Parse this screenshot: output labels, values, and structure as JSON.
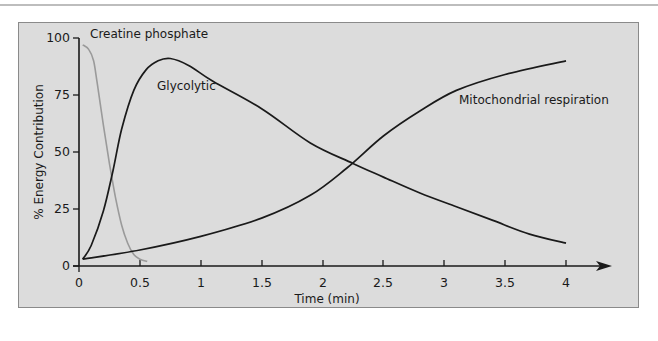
{
  "chart_data": {
    "type": "line",
    "title": "",
    "xlabel": "Time (min)",
    "ylabel": "% Energy Contribution",
    "xlim": [
      0,
      4
    ],
    "ylim": [
      0,
      100
    ],
    "x_ticks": [
      "0",
      "0.5",
      "1",
      "1.5",
      "2",
      "2.5",
      "3",
      "3.5",
      "4"
    ],
    "y_ticks": [
      "0",
      "25",
      "50",
      "75",
      "100"
    ],
    "grid": false,
    "legend": "inline labels",
    "series": [
      {
        "name": "Creatine phosphate",
        "color": "#9a9a9a",
        "points": [
          [
            0.03,
            97
          ],
          [
            0.08,
            95
          ],
          [
            0.12,
            90
          ],
          [
            0.15,
            80
          ],
          [
            0.2,
            62
          ],
          [
            0.25,
            45
          ],
          [
            0.3,
            30
          ],
          [
            0.35,
            18
          ],
          [
            0.4,
            10
          ],
          [
            0.45,
            5
          ],
          [
            0.5,
            3
          ],
          [
            0.56,
            2
          ]
        ]
      },
      {
        "name": "Glycolytic",
        "color": "#1a1a1a",
        "points": [
          [
            0.03,
            3
          ],
          [
            0.1,
            9
          ],
          [
            0.2,
            24
          ],
          [
            0.28,
            42
          ],
          [
            0.35,
            60
          ],
          [
            0.45,
            77
          ],
          [
            0.55,
            86
          ],
          [
            0.65,
            90
          ],
          [
            0.75,
            91
          ],
          [
            0.9,
            88
          ],
          [
            1.1,
            81
          ],
          [
            1.5,
            69
          ],
          [
            1.9,
            54
          ],
          [
            2.25,
            45
          ],
          [
            2.5,
            39
          ],
          [
            2.8,
            32
          ],
          [
            3.1,
            26
          ],
          [
            3.4,
            20
          ],
          [
            3.7,
            14
          ],
          [
            4.0,
            10
          ]
        ]
      },
      {
        "name": "Mitochondrial respiration",
        "color": "#1a1a1a",
        "points": [
          [
            0.03,
            3
          ],
          [
            0.5,
            7
          ],
          [
            1.0,
            13
          ],
          [
            1.5,
            21
          ],
          [
            1.9,
            31
          ],
          [
            2.2,
            43
          ],
          [
            2.5,
            57
          ],
          [
            2.8,
            68
          ],
          [
            3.1,
            77
          ],
          [
            3.5,
            84
          ],
          [
            4.0,
            90
          ]
        ]
      }
    ],
    "annotations": [
      {
        "text": "Creatine phosphate",
        "x": 0.1,
        "y": 100
      },
      {
        "text": "Glycolytic",
        "x": 0.55,
        "y": 80
      },
      {
        "text": "Mitochondrial respiration",
        "x": 2.85,
        "y": 70
      }
    ]
  },
  "labels": {
    "creatine": "Creatine phosphate",
    "glycolytic": "Glycolytic",
    "mito": "Mitochondrial respiration",
    "xlabel": "Time (min)",
    "ylabel": "% Energy Contribution"
  },
  "ticks": {
    "x": [
      "0",
      "0.5",
      "1",
      "1.5",
      "2",
      "2.5",
      "3",
      "3.5",
      "4"
    ],
    "y": [
      "0",
      "25",
      "50",
      "75",
      "100"
    ]
  }
}
